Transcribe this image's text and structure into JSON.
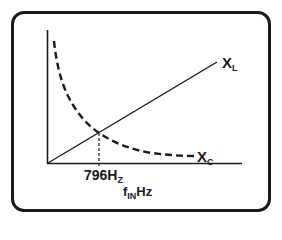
{
  "diagram": {
    "curves": [
      {
        "id": "XL",
        "label_main": "X",
        "label_sub": "L",
        "style": "solid",
        "shape": "straight line increasing with frequency"
      },
      {
        "id": "XC",
        "label_main": "X",
        "label_sub": "C",
        "style": "dashed",
        "shape": "hyperbolic decreasing with frequency"
      }
    ],
    "crossover": {
      "label_main": "796H",
      "label_sub": "Z",
      "value": 796,
      "unit": "Hz"
    },
    "x_axis": {
      "label_main": "f",
      "label_sub": "IN",
      "label_unit": "Hz"
    },
    "colors": {
      "stroke": "#1a1a1a",
      "background": "#ffffff"
    }
  }
}
